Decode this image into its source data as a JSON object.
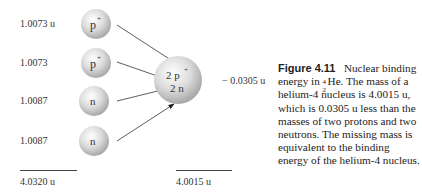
{
  "figure": {
    "left_masses": [
      {
        "value": "1.0073 u",
        "particle": "p",
        "charge": "+"
      },
      {
        "value": "1.0073",
        "particle": "p",
        "charge": "+"
      },
      {
        "value": "1.0087",
        "particle": "n",
        "charge": ""
      },
      {
        "value": "1.0087",
        "particle": "n",
        "charge": ""
      }
    ],
    "left_total": "4.0320 u",
    "nucleus": {
      "line1_count": "2",
      "line1_particle": "p",
      "line1_charge": "+",
      "line2": "2 n"
    },
    "mass_defect": "− 0.0305 u",
    "nucleus_total": "4.0015 u"
  },
  "caption": {
    "label": "Figure 4.11",
    "title_pre": "Nuclear binding energy in ",
    "isotope_mass": "4",
    "isotope_atomic": "2",
    "isotope_symbol": "He.",
    "body": "The mass of a helium-4 nucleus is 4.0015 u, which is 0.0305 u less than the masses of two protons and two neutrons. The missing mass is equivalent to the binding energy of the helium-4 nucleus."
  }
}
